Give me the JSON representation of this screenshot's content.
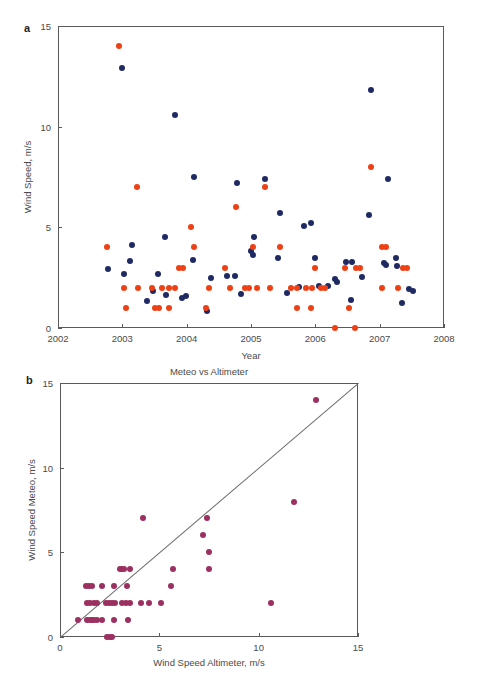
{
  "figure": {
    "panel_a_letter": "a",
    "panel_b_letter": "b"
  },
  "chart_data": [
    {
      "type": "scatter",
      "panel": "a",
      "title": "",
      "xlabel": "Year",
      "ylabel": "Wind Speed, m/s",
      "xlim": [
        2002,
        2008
      ],
      "ylim": [
        0,
        15
      ],
      "xticks": [
        2002,
        2003,
        2004,
        2005,
        2006,
        2007,
        2008
      ],
      "xticklabels": [
        "2002",
        "2003",
        "2004",
        "2005",
        "2006",
        "2007",
        "2008"
      ],
      "yticks": [
        0,
        5,
        10,
        15
      ],
      "yticklabels": [
        "0",
        "5",
        "10",
        "15"
      ],
      "grid": false,
      "legend": "none",
      "series": [
        {
          "name": "Altimeter",
          "color": "#1f2a63",
          "points": [
            [
              2002.99,
              12.9
            ],
            [
              2003.82,
              10.6
            ],
            [
              2006.87,
              11.8
            ],
            [
              2004.11,
              7.5
            ],
            [
              2004.78,
              7.2
            ],
            [
              2005.22,
              7.4
            ],
            [
              2007.13,
              7.4
            ],
            [
              2005.45,
              5.7
            ],
            [
              2006.84,
              5.6
            ],
            [
              2005.93,
              5.2
            ],
            [
              2005.83,
              5.05
            ],
            [
              2003.66,
              4.5
            ],
            [
              2005.05,
              4.5
            ],
            [
              2003.15,
              4.1
            ],
            [
              2005.0,
              3.8
            ],
            [
              2005.03,
              3.65
            ],
            [
              2005.42,
              3.5
            ],
            [
              2004.1,
              3.4
            ],
            [
              2005.99,
              3.5
            ],
            [
              2006.48,
              3.3
            ],
            [
              2006.57,
              3.3
            ],
            [
              2007.06,
              3.25
            ],
            [
              2007.1,
              3.15
            ],
            [
              2007.25,
              3.5
            ],
            [
              2007.27,
              3.1
            ],
            [
              2003.12,
              3.35
            ],
            [
              2002.78,
              2.95
            ],
            [
              2003.02,
              2.7
            ],
            [
              2003.55,
              2.7
            ],
            [
              2004.38,
              2.5
            ],
            [
              2004.62,
              2.6
            ],
            [
              2004.75,
              2.6
            ],
            [
              2006.3,
              2.45
            ],
            [
              2006.33,
              2.3
            ],
            [
              2006.72,
              2.55
            ],
            [
              2006.2,
              2.1
            ],
            [
              2006.05,
              2.1
            ],
            [
              2005.74,
              2.05
            ],
            [
              2003.47,
              1.85
            ],
            [
              2003.68,
              1.65
            ],
            [
              2004.85,
              1.7
            ],
            [
              2005.56,
              1.75
            ],
            [
              2003.99,
              1.6
            ],
            [
              2003.93,
              1.5
            ],
            [
              2007.45,
              1.95
            ],
            [
              2007.52,
              1.85
            ],
            [
              2006.55,
              1.4
            ],
            [
              2007.35,
              1.25
            ],
            [
              2003.38,
              1.35
            ],
            [
              2004.31,
              0.85
            ]
          ]
        },
        {
          "name": "Meteo",
          "color": "#ee4015",
          "points": [
            [
              2002.95,
              14.0
            ],
            [
              2006.86,
              8.0
            ],
            [
              2003.23,
              7.0
            ],
            [
              2005.22,
              7.0
            ],
            [
              2004.77,
              6.0
            ],
            [
              2004.07,
              5.0
            ],
            [
              2002.76,
              4.0
            ],
            [
              2004.12,
              4.0
            ],
            [
              2005.03,
              4.0
            ],
            [
              2005.45,
              4.0
            ],
            [
              2007.04,
              4.0
            ],
            [
              2007.1,
              4.0
            ],
            [
              2003.88,
              3.0
            ],
            [
              2003.95,
              3.0
            ],
            [
              2004.6,
              3.0
            ],
            [
              2006.0,
              3.0
            ],
            [
              2006.46,
              3.0
            ],
            [
              2006.63,
              3.0
            ],
            [
              2006.7,
              3.0
            ],
            [
              2007.36,
              3.0
            ],
            [
              2007.42,
              3.0
            ],
            [
              2003.02,
              2.0
            ],
            [
              2003.25,
              2.0
            ],
            [
              2003.46,
              2.0
            ],
            [
              2003.62,
              2.0
            ],
            [
              2003.73,
              2.0
            ],
            [
              2003.82,
              2.0
            ],
            [
              2004.35,
              2.0
            ],
            [
              2004.68,
              2.0
            ],
            [
              2004.9,
              2.0
            ],
            [
              2004.97,
              2.0
            ],
            [
              2005.09,
              2.0
            ],
            [
              2005.3,
              2.0
            ],
            [
              2005.62,
              2.0
            ],
            [
              2005.72,
              2.0
            ],
            [
              2005.85,
              2.0
            ],
            [
              2005.95,
              2.0
            ],
            [
              2006.09,
              2.0
            ],
            [
              2006.15,
              2.0
            ],
            [
              2007.03,
              2.0
            ],
            [
              2007.28,
              2.0
            ],
            [
              2003.06,
              1.0
            ],
            [
              2003.51,
              1.0
            ],
            [
              2003.57,
              1.0
            ],
            [
              2003.72,
              1.0
            ],
            [
              2004.3,
              1.0
            ],
            [
              2005.72,
              1.0
            ],
            [
              2005.93,
              1.0
            ],
            [
              2006.53,
              1.0
            ],
            [
              2006.31,
              0.0
            ],
            [
              2006.61,
              0.0
            ]
          ]
        }
      ]
    },
    {
      "type": "scatter",
      "panel": "b",
      "title": "Meteo vs Altimeter",
      "xlabel": "Wind Speed Altimeter, m/s",
      "ylabel": "Wind Speed Meteo, m/s",
      "xlim": [
        0,
        15
      ],
      "ylim": [
        0,
        15
      ],
      "xticks": [
        0,
        5,
        10,
        15
      ],
      "xticklabels": [
        "0",
        "5",
        "10",
        "15"
      ],
      "yticks": [
        0,
        5,
        10,
        15
      ],
      "yticklabels": [
        "0",
        "5",
        "10",
        "15"
      ],
      "grid": false,
      "legend": "none",
      "reference_line": {
        "name": "one-to-one-line",
        "from": [
          0,
          0
        ],
        "to": [
          15,
          15
        ],
        "color": "#6b6b6b"
      },
      "series": [
        {
          "name": "Meteo vs Altimeter",
          "color": "#9c3060",
          "points": [
            [
              12.9,
              14.0
            ],
            [
              11.8,
              8.0
            ],
            [
              4.2,
              7.0
            ],
            [
              7.4,
              7.0
            ],
            [
              7.2,
              6.0
            ],
            [
              7.5,
              5.0
            ],
            [
              3.0,
              4.0
            ],
            [
              3.1,
              4.0
            ],
            [
              3.2,
              4.0
            ],
            [
              3.5,
              4.0
            ],
            [
              5.7,
              4.0
            ],
            [
              7.5,
              4.0
            ],
            [
              1.3,
              3.0
            ],
            [
              1.45,
              3.0
            ],
            [
              1.6,
              3.0
            ],
            [
              2.1,
              3.0
            ],
            [
              2.7,
              3.0
            ],
            [
              3.35,
              3.0
            ],
            [
              5.6,
              3.0
            ],
            [
              1.35,
              2.0
            ],
            [
              1.5,
              2.0
            ],
            [
              1.7,
              2.0
            ],
            [
              1.85,
              2.0
            ],
            [
              2.3,
              2.0
            ],
            [
              2.45,
              2.0
            ],
            [
              2.6,
              2.0
            ],
            [
              2.75,
              2.0
            ],
            [
              3.1,
              2.0
            ],
            [
              3.3,
              2.0
            ],
            [
              3.5,
              2.0
            ],
            [
              4.1,
              2.0
            ],
            [
              4.5,
              2.0
            ],
            [
              5.1,
              2.0
            ],
            [
              10.6,
              2.0
            ],
            [
              0.9,
              1.0
            ],
            [
              1.35,
              1.0
            ],
            [
              1.5,
              1.0
            ],
            [
              1.6,
              1.0
            ],
            [
              1.7,
              1.0
            ],
            [
              1.85,
              1.0
            ],
            [
              2.1,
              1.0
            ],
            [
              2.7,
              1.0
            ],
            [
              3.4,
              1.0
            ],
            [
              2.35,
              0.0
            ],
            [
              2.5,
              0.0
            ],
            [
              2.6,
              0.0
            ]
          ]
        }
      ]
    }
  ]
}
